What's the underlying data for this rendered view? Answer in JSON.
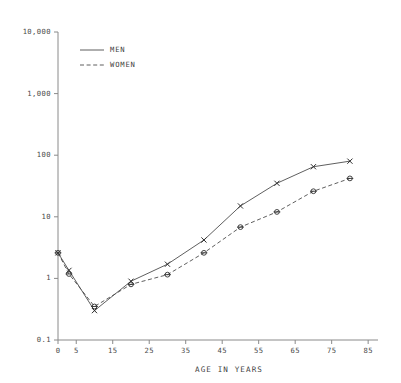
{
  "chart_data": {
    "type": "line",
    "title": "",
    "xlabel": "AGE IN YEARS",
    "ylabel": "",
    "yscale": "log",
    "ylim": [
      0.1,
      10000
    ],
    "xlim": [
      0,
      88
    ],
    "grid": false,
    "legend_position": "top-left",
    "x": [
      0,
      3,
      10,
      20,
      30,
      40,
      50,
      60,
      70,
      80
    ],
    "ytick_labels": [
      "10,000",
      "1,000",
      "100",
      "10",
      "1",
      "0.1"
    ],
    "ytick_values": [
      10000,
      1000,
      100,
      10,
      1,
      0.1
    ],
    "xtick_labels": [
      "0",
      "5",
      "15",
      "25",
      "35",
      "45",
      "55",
      "65",
      "75",
      "85"
    ],
    "xtick_values": [
      0,
      5,
      15,
      25,
      35,
      45,
      55,
      65,
      75,
      85
    ],
    "series": [
      {
        "name": "MEN",
        "style": "solid",
        "marker": "x",
        "values": [
          2.6,
          1.35,
          0.3,
          0.9,
          1.7,
          4.2,
          15.0,
          35.0,
          65.0,
          80.0
        ]
      },
      {
        "name": "WOMEN",
        "style": "dashed",
        "marker": "circle",
        "values": [
          2.6,
          1.18,
          0.35,
          0.8,
          1.15,
          2.6,
          6.8,
          12.0,
          26.0,
          42.0
        ]
      }
    ],
    "colors": {
      "men_line": "#4d4d4d",
      "women_line": "#4d4d4d",
      "axis": "#8a8a8a",
      "text": "#3f3f3f",
      "background": "#ffffff"
    }
  },
  "legend": {
    "entries": [
      {
        "label": "MEN"
      },
      {
        "label": "WOMEN"
      }
    ]
  }
}
